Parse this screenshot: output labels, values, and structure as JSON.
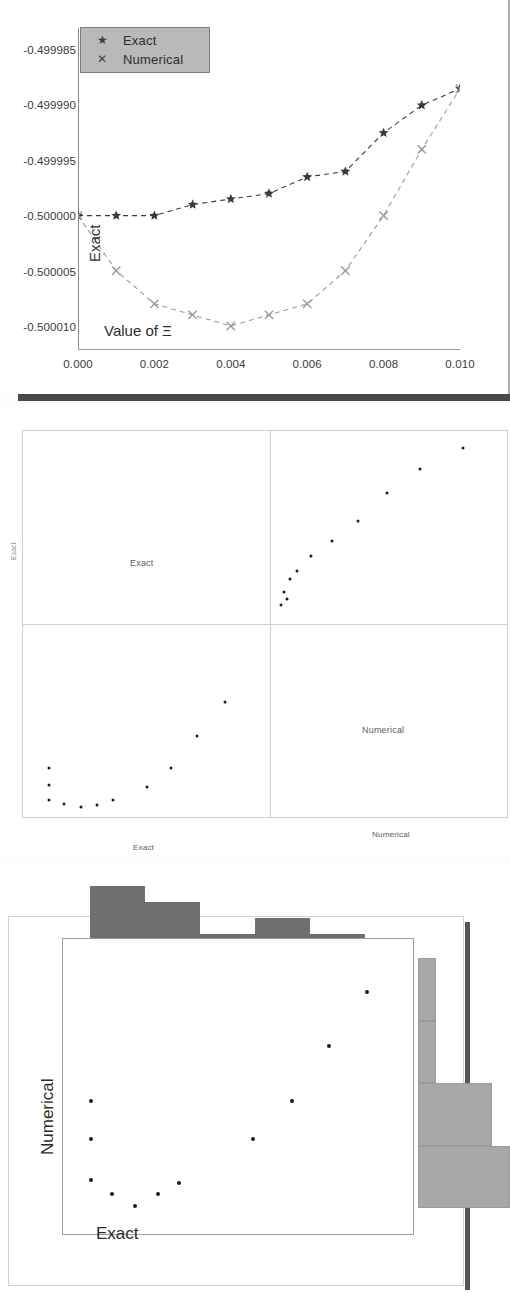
{
  "figure": {
    "panels": [
      "line-chart",
      "scatter-matrix",
      "scatter-with-marginal-histograms"
    ]
  },
  "panel1": {
    "ylabel": "Exact",
    "xlabel": "Value of Ξ",
    "legend": {
      "items": [
        {
          "label": "Exact",
          "glyph": "★",
          "marker": "star",
          "color": "#3b3b3b"
        },
        {
          "label": "Numerical",
          "glyph": "✕",
          "marker": "x",
          "color": "#8a8a8a"
        }
      ],
      "background": "#b9b9b9"
    },
    "yticks": [
      "-0.499985",
      "-0.499990",
      "-0.499995",
      "-0.500000",
      "-0.500005",
      "-0.500010"
    ],
    "xticks": [
      "0.000",
      "0.002",
      "0.004",
      "0.006",
      "0.008",
      "0.010"
    ]
  },
  "chart_data": [
    {
      "type": "line",
      "title": "",
      "xlabel": "Value of Ξ",
      "ylabel": "Exact",
      "xlim": [
        0.0,
        0.01
      ],
      "ylim": [
        -0.500012,
        -0.499983
      ],
      "xticks": [
        0.0,
        0.002,
        0.004,
        0.006,
        0.008,
        0.01
      ],
      "yticks": [
        -0.499985,
        -0.49999,
        -0.499995,
        -0.5,
        -0.500005,
        -0.50001
      ],
      "grid": false,
      "legend_position": "top-left",
      "x": [
        0.0,
        0.001,
        0.002,
        0.003,
        0.004,
        0.005,
        0.006,
        0.007,
        0.008,
        0.009,
        0.01
      ],
      "series": [
        {
          "name": "Exact",
          "marker": "star",
          "linestyle": "dashed",
          "color": "#3b3b3b",
          "values": [
            -0.5,
            -0.5,
            -0.5,
            -0.499999,
            -0.4999985,
            -0.499998,
            -0.4999965,
            -0.499996,
            -0.4999925,
            -0.49999,
            -0.4999885
          ]
        },
        {
          "name": "Numerical",
          "marker": "x",
          "linestyle": "dashed",
          "color": "#9a9a9a",
          "values": [
            -0.5,
            -0.500005,
            -0.500008,
            -0.500009,
            -0.50001,
            -0.500009,
            -0.500008,
            -0.500005,
            -0.5,
            -0.499994,
            -0.4999885
          ]
        }
      ]
    },
    {
      "type": "scatter",
      "layout": "scatter-matrix",
      "variables": [
        "Exact",
        "Numerical"
      ],
      "grid": true,
      "cell_labels": [
        "Exact",
        "Numerical"
      ],
      "axis_labels": {
        "bottom_left": "Exact",
        "bottom_right": "Numerical",
        "left": "Exact"
      },
      "cells": [
        {
          "row": "Exact",
          "col": "Numerical",
          "position": "top-right",
          "points": [
            [
              0.035,
              0.085
            ],
            [
              0.06,
              0.12
            ],
            [
              0.048,
              0.155
            ],
            [
              0.07,
              0.225
            ],
            [
              0.1,
              0.27
            ],
            [
              0.16,
              0.35
            ],
            [
              0.25,
              0.43
            ],
            [
              0.36,
              0.54
            ],
            [
              0.48,
              0.69
            ],
            [
              0.62,
              0.815
            ],
            [
              0.8,
              0.93
            ]
          ]
        },
        {
          "row": "Numerical",
          "col": "Exact",
          "position": "bottom-left",
          "points": [
            [
              0.095,
              0.245
            ],
            [
              0.095,
              0.155
            ],
            [
              0.095,
              0.075
            ],
            [
              0.16,
              0.052
            ],
            [
              0.23,
              0.035
            ],
            [
              0.3,
              0.05
            ],
            [
              0.365,
              0.075
            ],
            [
              0.51,
              0.145
            ],
            [
              0.61,
              0.245
            ],
            [
              0.72,
              0.42
            ],
            [
              0.84,
              0.6
            ]
          ]
        }
      ]
    },
    {
      "type": "scatter",
      "layout": "scatter-with-marginal-histograms",
      "xlabel": "Exact",
      "ylabel": "Numerical",
      "grid": false,
      "points": [
        [
          0.08,
          0.455
        ],
        [
          0.08,
          0.325
        ],
        [
          0.08,
          0.19
        ],
        [
          0.14,
          0.14
        ],
        [
          0.205,
          0.1
        ],
        [
          0.27,
          0.14
        ],
        [
          0.33,
          0.18
        ],
        [
          0.54,
          0.325
        ],
        [
          0.65,
          0.455
        ],
        [
          0.755,
          0.64
        ],
        [
          0.865,
          0.82
        ]
      ],
      "hist_top": {
        "orientation": "vertical",
        "bins": 6,
        "counts": [
          4,
          3,
          1,
          2,
          1,
          0
        ],
        "color": "#6f6f6f"
      },
      "hist_right": {
        "orientation": "horizontal",
        "bins": 4,
        "counts": [
          1,
          1,
          4,
          5
        ],
        "color": "#a8a8a8"
      }
    }
  ],
  "panel2": {
    "cell_labels": {
      "top_left": "Exact",
      "bottom_right": "Numerical"
    },
    "axis_labels": {
      "bottom_left": "Exact",
      "bottom_right": "Numerical",
      "left": "Exact"
    }
  },
  "panel3": {
    "ylabel": "Numerical",
    "xlabel": "Exact"
  }
}
